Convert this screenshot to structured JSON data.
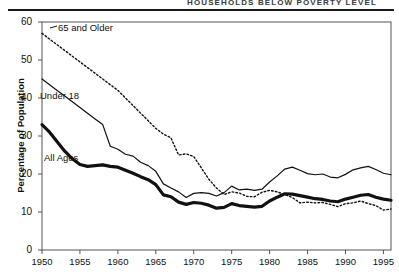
{
  "header": {
    "title": "HOUSEHOLDS BELOW POVERTY LEVEL",
    "rule_color": "#1a1a1a"
  },
  "axes": {
    "ylabel": "Percentage of Population",
    "yticks": [
      "0",
      "10",
      "20",
      "30",
      "40",
      "50",
      "60"
    ],
    "xticks": [
      "1950",
      "1955",
      "1960",
      "1965",
      "1970",
      "1975",
      "1980",
      "1985",
      "1990",
      "1995"
    ]
  },
  "series_labels": {
    "older": "65 and Older",
    "under18": "Under 18",
    "allages": "All Ages"
  },
  "colors": {
    "line": "#111111",
    "axis": "#555555",
    "background": "#ffffff"
  },
  "chart_data": {
    "type": "line",
    "title": "HOUSEHOLDS BELOW POVERTY LEVEL",
    "xlabel": "",
    "ylabel": "Percentage of Population",
    "xlim": [
      1950,
      1996
    ],
    "ylim": [
      0,
      60
    ],
    "grid": false,
    "legend_position": "inline-annotations",
    "x": [
      1950,
      1951,
      1952,
      1953,
      1954,
      1955,
      1956,
      1957,
      1958,
      1959,
      1960,
      1961,
      1962,
      1963,
      1964,
      1965,
      1966,
      1967,
      1968,
      1969,
      1970,
      1971,
      1972,
      1973,
      1974,
      1975,
      1976,
      1977,
      1978,
      1979,
      1980,
      1981,
      1982,
      1983,
      1984,
      1985,
      1986,
      1987,
      1988,
      1989,
      1990,
      1991,
      1992,
      1993,
      1994,
      1995,
      1996
    ],
    "series": [
      {
        "name": "65 and Older",
        "style": "dotted",
        "width": 1.4,
        "values": [
          57.0,
          55.5,
          54.0,
          52.5,
          51.0,
          49.5,
          48.0,
          46.5,
          45.0,
          43.5,
          42.0,
          40.0,
          38.0,
          36.0,
          34.0,
          32.0,
          30.5,
          29.5,
          25.0,
          25.3,
          24.6,
          21.6,
          18.6,
          16.3,
          14.6,
          15.3,
          15.0,
          14.1,
          14.0,
          15.2,
          15.7,
          15.3,
          14.6,
          13.8,
          12.4,
          12.6,
          12.4,
          12.5,
          12.0,
          11.4,
          12.2,
          12.4,
          12.9,
          12.2,
          11.7,
          10.5,
          10.8
        ]
      },
      {
        "name": "Under 18",
        "style": "solid-thin",
        "width": 1.2,
        "values": [
          45.0,
          43.5,
          42.0,
          40.5,
          39.0,
          37.5,
          36.0,
          34.5,
          33.0,
          27.3,
          26.5,
          25.2,
          24.7,
          23.1,
          22.2,
          20.7,
          17.4,
          16.3,
          15.3,
          13.8,
          14.9,
          15.1,
          14.9,
          14.2,
          15.1,
          16.8,
          15.8,
          16.0,
          15.7,
          16.0,
          17.9,
          19.5,
          21.3,
          21.8,
          21.0,
          20.1,
          19.8,
          20.0,
          19.2,
          19.0,
          19.9,
          21.1,
          21.6,
          22.0,
          21.2,
          20.2,
          19.8
        ]
      },
      {
        "name": "All Ages",
        "style": "solid-thick",
        "width": 3.2,
        "values": [
          33.0,
          31.0,
          28.5,
          26.0,
          24.0,
          22.5,
          22.0,
          22.2,
          22.4,
          22.0,
          21.8,
          21.0,
          20.2,
          19.3,
          18.5,
          17.2,
          14.5,
          14.0,
          12.6,
          12.0,
          12.5,
          12.3,
          11.8,
          11.0,
          11.2,
          12.2,
          11.7,
          11.5,
          11.3,
          11.5,
          12.9,
          13.9,
          14.8,
          14.7,
          14.3,
          13.9,
          13.5,
          13.3,
          12.9,
          12.7,
          13.4,
          13.9,
          14.4,
          14.6,
          13.9,
          13.4,
          13.1
        ]
      }
    ]
  }
}
